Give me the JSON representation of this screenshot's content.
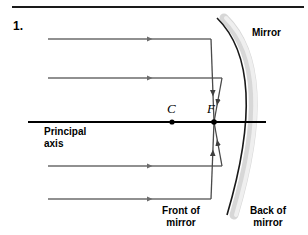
{
  "figure": {
    "number": "1.",
    "title_labels": {
      "mirror": "Mirror",
      "principal_axis": "Principal\naxis",
      "front_of_mirror": "Front of\nmirror",
      "back_of_mirror": "Back of\nmirror",
      "center_of_curvature": "C",
      "focal_point": "F"
    }
  },
  "colors": {
    "ray": "#6b6b6b",
    "reflected_ray": "#4a4a4a",
    "axis": "#000000",
    "mirror_surface": "#1a1a1a",
    "mirror_body": "#d9d9d9",
    "text": "#000000",
    "rule": "#1a1a1a"
  },
  "diagram_data": {
    "type": "ray-diagram",
    "subject": "concave spherical mirror reflecting parallel rays through the focal point",
    "canvas": {
      "width": 308,
      "height": 235
    },
    "principal_axis": {
      "x_start": 28,
      "x_end": 266,
      "y": 122
    },
    "points": [
      {
        "name": "C",
        "label": "C",
        "x": 172,
        "y": 122
      },
      {
        "name": "F",
        "label": "F",
        "x": 214,
        "y": 122
      }
    ],
    "mirror": {
      "arc_top": {
        "x": 217,
        "y": 18
      },
      "arc_vertex": {
        "x": 266,
        "y": 122
      },
      "arc_bottom": {
        "x": 227,
        "y": 215
      },
      "thickness": 8
    },
    "incoming_rays": [
      {
        "id": "ray-1",
        "y": 39,
        "x_start": 48,
        "x_hit": 211
      },
      {
        "id": "ray-2",
        "y": 78,
        "x_start": 48,
        "x_hit": 222
      },
      {
        "id": "ray-3",
        "y": 166,
        "x_start": 48,
        "x_hit": 222
      },
      {
        "id": "ray-4",
        "y": 199,
        "x_start": 48,
        "x_hit": 211
      }
    ],
    "reflected_rays": [
      {
        "id": "reflected-1",
        "from_x": 211,
        "from_y": 39,
        "to_x": 214,
        "to_y": 122
      },
      {
        "id": "reflected-2",
        "from_x": 222,
        "from_y": 78,
        "to_x": 214,
        "to_y": 122
      },
      {
        "id": "reflected-3",
        "from_x": 222,
        "from_y": 166,
        "to_x": 214,
        "to_y": 122
      },
      {
        "id": "reflected-4",
        "from_x": 211,
        "from_y": 199,
        "to_x": 214,
        "to_y": 122
      }
    ]
  }
}
